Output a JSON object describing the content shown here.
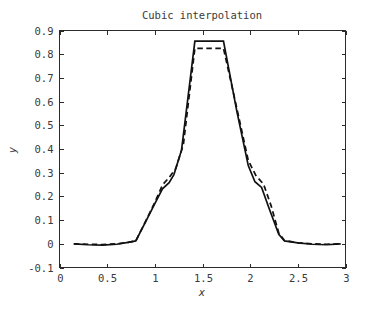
{
  "figure": {
    "background": "#ffffff",
    "axis_color": "#2b2b2b",
    "text_color": "#3a3a3a",
    "line_color": "#111111"
  },
  "chart_data": {
    "type": "line",
    "title": "Cubic interpolation",
    "xlabel": "x",
    "ylabel": "y",
    "xlim": [
      0,
      3
    ],
    "ylim": [
      -0.1,
      0.9
    ],
    "xticks": [
      0,
      0.5,
      1,
      1.5,
      2,
      2.5,
      3
    ],
    "xtick_labels": [
      "0",
      "0.5",
      "1",
      "1.5",
      "2",
      "2.5",
      "3"
    ],
    "yticks": [
      -0.1,
      0,
      0.1,
      0.2,
      0.3,
      0.4,
      0.5,
      0.6,
      0.7,
      0.8,
      0.9
    ],
    "ytick_labels": [
      "-0.1",
      "0",
      "0.1",
      "0.2",
      "0.3",
      "0.4",
      "0.5",
      "0.6",
      "0.7",
      "0.8",
      "0.9"
    ],
    "grid": false,
    "legend": "none",
    "series": [
      {
        "name": "cubic interpolation",
        "style": "solid",
        "color": "#111111",
        "x": [
          0.15,
          0.3,
          0.45,
          0.6,
          0.72,
          0.8,
          0.9,
          1.0,
          1.08,
          1.15,
          1.2,
          1.28,
          1.42,
          1.55,
          1.72,
          1.86,
          1.98,
          2.05,
          2.12,
          2.2,
          2.3,
          2.36,
          2.5,
          2.65,
          2.8,
          2.95
        ],
        "y": [
          0.0,
          -0.004,
          -0.006,
          -0.002,
          0.006,
          0.012,
          0.09,
          0.17,
          0.232,
          0.258,
          0.292,
          0.395,
          0.855,
          0.855,
          0.855,
          0.56,
          0.33,
          0.262,
          0.238,
          0.148,
          0.04,
          0.012,
          0.004,
          -0.002,
          -0.004,
          0.0
        ]
      },
      {
        "name": "reference signal",
        "style": "dashed",
        "color": "#111111",
        "x": [
          0.15,
          0.3,
          0.45,
          0.6,
          0.72,
          0.8,
          0.9,
          1.0,
          1.08,
          1.15,
          1.22,
          1.3,
          1.42,
          1.55,
          1.72,
          1.86,
          1.98,
          2.06,
          2.14,
          2.22,
          2.3,
          2.36,
          2.5,
          2.65,
          2.8,
          2.95
        ],
        "y": [
          0.0,
          -0.002,
          -0.003,
          0.0,
          0.006,
          0.012,
          0.092,
          0.175,
          0.248,
          0.28,
          0.318,
          0.42,
          0.825,
          0.825,
          0.825,
          0.572,
          0.352,
          0.288,
          0.252,
          0.16,
          0.046,
          0.014,
          0.004,
          0.0,
          -0.002,
          0.0
        ]
      }
    ]
  }
}
